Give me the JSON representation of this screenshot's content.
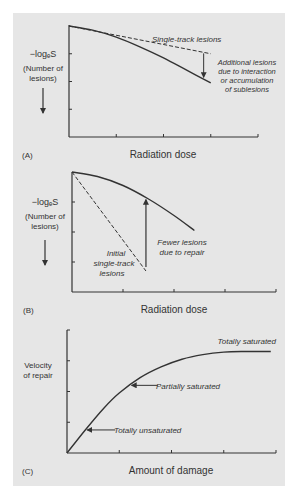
{
  "chart_data": [
    {
      "panel": "A",
      "type": "line",
      "panel_label": "(A)",
      "xlabel": "Radiation dose",
      "ylabel_lines": [
        "−logₑS",
        "(Number of",
        "lesions)"
      ],
      "ylabel_arrow": "down",
      "grid": false,
      "x_ticks": 4,
      "y_ticks": 3,
      "xlim": [
        0,
        4
      ],
      "ylim": [
        0,
        4
      ],
      "series": [
        {
          "name": "Single-track lesions",
          "style": "dashed",
          "x": [
            0,
            3
          ],
          "y": [
            0,
            1.0
          ]
        },
        {
          "name": "Observed lesions",
          "style": "solid",
          "x": [
            0,
            0.5,
            1.0,
            1.5,
            2.0,
            2.5,
            3.0
          ],
          "y": [
            0,
            0.15,
            0.4,
            0.75,
            1.15,
            1.6,
            2.05
          ]
        }
      ],
      "annotations": [
        {
          "text": "Single-track lesions",
          "italic": true
        },
        {
          "text_lines": [
            "Additional lesions",
            "due to interaction",
            "or accumulation",
            "of sublesions"
          ],
          "italic": true,
          "arrow": "down",
          "from_series": "Single-track lesions",
          "to_series": "Observed lesions",
          "at_x": 2.85
        }
      ]
    },
    {
      "panel": "B",
      "type": "line",
      "panel_label": "(B)",
      "xlabel": "Radiation dose",
      "ylabel_lines": [
        "−logₑS",
        "(Number of",
        "lesions)"
      ],
      "ylabel_arrow": "down",
      "grid": false,
      "x_ticks": 4,
      "y_ticks": 3,
      "xlim": [
        0,
        4
      ],
      "ylim": [
        0,
        4
      ],
      "series": [
        {
          "name": "Initial single-track lesions",
          "style": "dashed",
          "x": [
            0,
            1.45
          ],
          "y": [
            0,
            3.3
          ]
        },
        {
          "name": "Observed lesions",
          "style": "solid",
          "x": [
            0,
            0.5,
            1.0,
            1.5,
            2.0,
            2.4
          ],
          "y": [
            0,
            0.15,
            0.45,
            0.9,
            1.45,
            1.95
          ]
        }
      ],
      "annotations": [
        {
          "text_lines": [
            "Initial",
            "single-track",
            "lesions"
          ],
          "italic": true
        },
        {
          "text_lines": [
            "Fewer lesions",
            "due to repair"
          ],
          "italic": true,
          "arrow": "up",
          "at_x": 1.45
        }
      ]
    },
    {
      "panel": "C",
      "type": "line",
      "panel_label": "(C)",
      "xlabel": "Amount of damage",
      "ylabel_lines": [
        "Velocity",
        "of repair"
      ],
      "grid": false,
      "x_ticks": 4,
      "y_ticks": 3,
      "xlim": [
        0,
        4
      ],
      "ylim": [
        0,
        4
      ],
      "series": [
        {
          "name": "Velocity of repair",
          "style": "solid",
          "x": [
            0,
            0.35,
            0.7,
            1.0,
            1.4,
            1.8,
            2.2,
            2.6,
            3.0,
            3.4,
            3.9
          ],
          "y": [
            0,
            0.75,
            1.45,
            1.95,
            2.45,
            2.8,
            3.05,
            3.2,
            3.28,
            3.3,
            3.3
          ]
        }
      ],
      "annotations": [
        {
          "text": "Totally saturated",
          "italic": true
        },
        {
          "text": "Partially saturated",
          "italic": true,
          "arrow": "left",
          "at_x": 1.2
        },
        {
          "text": "Totally unsaturated",
          "italic": true,
          "arrow": "left",
          "at_x": 0.35
        }
      ]
    }
  ]
}
